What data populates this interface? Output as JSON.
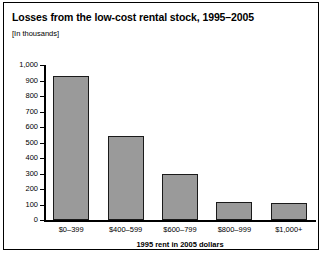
{
  "figure": {
    "title": "Losses from the low-cost rental stock, 1995–2005",
    "subtitle": "[In thousands]",
    "frame_color": "#000000",
    "bar_fill_color": "#9a9a9a",
    "bar_edge_color": "#1a1a1a",
    "background_color": "#ffffff"
  },
  "chart_data": {
    "type": "bar",
    "title": "Losses from the low-cost rental stock, 1995–2005",
    "subtitle": "[In thousands]",
    "categories": [
      "$0–399",
      "$400–599",
      "$600–799",
      "$800–999",
      "$1,000+"
    ],
    "values": [
      930,
      545,
      295,
      118,
      112
    ],
    "xlabel": "1995 rent in 2005 dollars",
    "ylabel": "",
    "ylim": [
      0,
      1000
    ],
    "ytick_values": [
      0,
      100,
      200,
      300,
      400,
      500,
      600,
      700,
      800,
      900,
      1000
    ],
    "ytick_labels": [
      "0",
      "100",
      "200",
      "300",
      "400",
      "500",
      "600",
      "700",
      "800",
      "900",
      "1,000"
    ],
    "grid": false,
    "legend": false,
    "legend_position": "none"
  }
}
